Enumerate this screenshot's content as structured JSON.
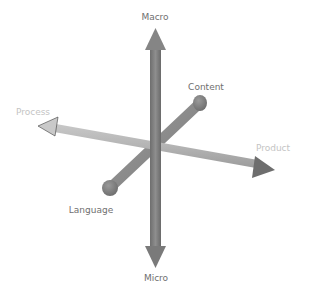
{
  "diagram": {
    "type": "3d-axes",
    "axes": [
      {
        "name": "vertical",
        "positive_label": "Macro",
        "negative_label": "Micro",
        "ends": [
          "arrow",
          "arrow"
        ]
      },
      {
        "name": "horizontal",
        "positive_label": "Product",
        "negative_label": "Process",
        "ends": [
          "arrow",
          "arrow"
        ]
      },
      {
        "name": "depth",
        "positive_label": "Content",
        "negative_label": "Language",
        "ends": [
          "ball",
          "ball"
        ]
      }
    ],
    "labels": {
      "macro": "Macro",
      "micro": "Micro",
      "process": "Process",
      "product": "Product",
      "content": "Content",
      "language": "Language"
    },
    "colors": {
      "vertical_axis": "#7a7a7a",
      "horizontal_axis": "#b0b0b0",
      "depth_axis": "#8c8c8c",
      "label_dark": "#6f6f6f",
      "label_light": "#c4c4c4"
    }
  }
}
